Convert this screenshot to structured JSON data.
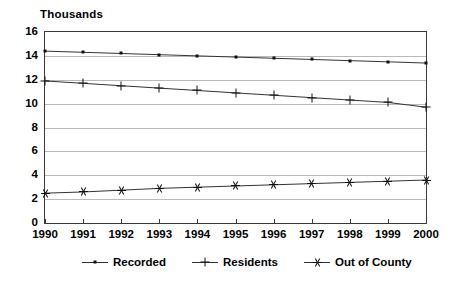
{
  "chart_data": {
    "type": "line",
    "title": "",
    "ylabel": "Thousands",
    "xlabel": "",
    "ylim": [
      0,
      16
    ],
    "yticks": [
      0,
      2,
      4,
      6,
      8,
      10,
      12,
      14,
      16
    ],
    "grid": true,
    "legend_position": "bottom",
    "categories": [
      "1990",
      "1991",
      "1992",
      "1993",
      "1994",
      "1995",
      "1996",
      "1997",
      "1998",
      "1999",
      "2000"
    ],
    "series": [
      {
        "name": "Recorded",
        "marker": "dot",
        "values": [
          14.4,
          14.3,
          14.2,
          14.1,
          14.0,
          13.9,
          13.8,
          13.7,
          13.6,
          13.5,
          13.4
        ]
      },
      {
        "name": "Residents",
        "marker": "plus",
        "values": [
          11.9,
          11.7,
          11.5,
          11.3,
          11.1,
          10.9,
          10.7,
          10.5,
          10.3,
          10.1,
          9.7
        ]
      },
      {
        "name": "Out of County",
        "marker": "star",
        "values": [
          2.5,
          2.6,
          2.75,
          2.9,
          3.0,
          3.1,
          3.2,
          3.3,
          3.4,
          3.5,
          3.6
        ]
      }
    ]
  },
  "axis": {
    "y_title": "Thousands"
  },
  "legend": {
    "items": [
      {
        "label": "Recorded"
      },
      {
        "label": "Residents"
      },
      {
        "label": "Out of County"
      }
    ]
  }
}
